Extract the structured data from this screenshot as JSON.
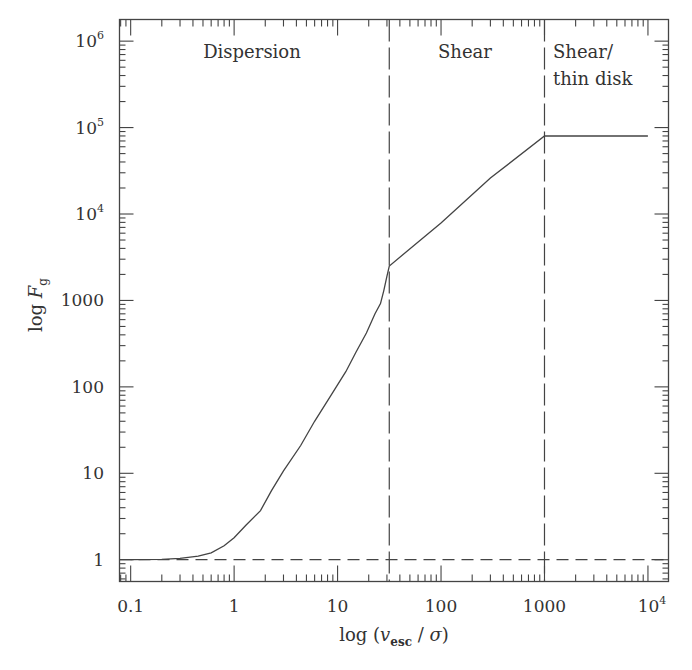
{
  "chart_data": {
    "type": "line",
    "title": "",
    "xlabel": "log (v_esc / σ)",
    "xlabel_parts": {
      "prefix": "log (",
      "var": "v",
      "sub": "esc",
      "mid": " / ",
      "sigma": "σ",
      "suffix": ")"
    },
    "ylabel": "log F_g",
    "ylabel_parts": {
      "prefix": "log ",
      "var": "F",
      "sub": "g"
    },
    "x_scale": "log",
    "y_scale": "log",
    "xlim": [
      0.078,
      15800
    ],
    "ylim": [
      0.56,
      1780000
    ],
    "grid": false,
    "legend": null,
    "x_ticks": [
      {
        "value": 0.1,
        "label": "0.1",
        "sup": ""
      },
      {
        "value": 1,
        "label": "1",
        "sup": ""
      },
      {
        "value": 10,
        "label": "10",
        "sup": ""
      },
      {
        "value": 100,
        "label": "100",
        "sup": ""
      },
      {
        "value": 1000,
        "label": "1000",
        "sup": ""
      },
      {
        "value": 10000,
        "label": "10",
        "sup": "4"
      }
    ],
    "y_ticks": [
      {
        "value": 1,
        "label": "1",
        "sup": ""
      },
      {
        "value": 10,
        "label": "10",
        "sup": ""
      },
      {
        "value": 100,
        "label": "100",
        "sup": ""
      },
      {
        "value": 1000,
        "label": "1000",
        "sup": ""
      },
      {
        "value": 10000,
        "label": "10",
        "sup": "4"
      },
      {
        "value": 100000,
        "label": "10",
        "sup": "5"
      },
      {
        "value": 1000000,
        "label": "10",
        "sup": "6"
      }
    ],
    "series": [
      {
        "name": "F_g",
        "style": "solid",
        "x": [
          0.1,
          0.2,
          0.3,
          0.45,
          0.6,
          0.8,
          1.0,
          1.3,
          1.8,
          2.3,
          3.0,
          4.4,
          6.0,
          8.6,
          12,
          15,
          19,
          23,
          26,
          28,
          30,
          31.6,
          100,
          300,
          1000,
          3000,
          10000
        ],
        "y": [
          1.0,
          1.01,
          1.04,
          1.1,
          1.2,
          1.45,
          1.8,
          2.5,
          3.7,
          6.3,
          10.7,
          21,
          40,
          79,
          150,
          250,
          420,
          700,
          920,
          1300,
          1900,
          2500,
          7900,
          26000,
          80000,
          80000,
          80000
        ]
      },
      {
        "name": "F_g = 1 reference",
        "style": "dashed",
        "x": [
          0.078,
          15800
        ],
        "y": [
          1,
          1
        ]
      }
    ],
    "vertical_lines": [
      {
        "x": 31.6,
        "style": "long-dash"
      },
      {
        "x": 1000,
        "style": "long-dash"
      }
    ],
    "annotations": [
      {
        "text": "Dispersion",
        "lines": [
          "Dispersion"
        ],
        "x_range": [
          0.078,
          31.6
        ]
      },
      {
        "text": "Shear",
        "lines": [
          "Shear"
        ],
        "x_range": [
          31.6,
          1000
        ]
      },
      {
        "text": "Shear/ thin disk",
        "lines": [
          "Shear/",
          "thin disk"
        ],
        "x_range": [
          1000,
          15800
        ]
      }
    ]
  },
  "colors": {
    "ink": "#444444",
    "background": "#ffffff"
  }
}
